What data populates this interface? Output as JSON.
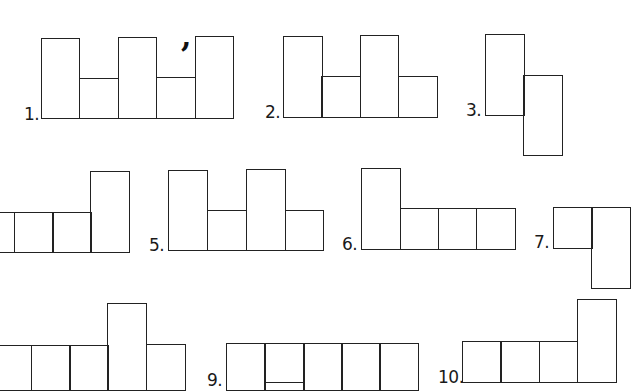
{
  "page": {
    "background": "#ffffff",
    "line_color": "#222222"
  },
  "figures": [
    {
      "label": "1.",
      "label_pos": [
        24,
        106
      ],
      "cells": [
        [
          41,
          38,
          38,
          80
        ],
        [
          79,
          78,
          39,
          40
        ],
        [
          118,
          37,
          38,
          81
        ],
        [
          156,
          77,
          39,
          41
        ],
        [
          195,
          36,
          38,
          82
        ]
      ],
      "mark": {
        "text": ",",
        "pos": [
          181,
          22
        ]
      }
    },
    {
      "label": "2.",
      "label_pos": [
        265,
        104
      ],
      "cells": [
        [
          283,
          36,
          39,
          81
        ],
        [
          321,
          76,
          39,
          41
        ],
        [
          360,
          35,
          38,
          82
        ],
        [
          398,
          76,
          39,
          41
        ]
      ]
    },
    {
      "label": "3.",
      "label_pos": [
        466,
        102
      ],
      "cells": [
        [
          485,
          34,
          39,
          81
        ],
        [
          523,
          75,
          39,
          80
        ]
      ]
    },
    {
      "label": "",
      "label_pos": [
        0,
        0
      ],
      "cells": [
        [
          -25,
          212,
          39,
          40
        ],
        [
          14,
          212,
          39,
          40
        ],
        [
          52,
          212,
          39,
          40
        ],
        [
          90,
          171,
          39,
          81
        ]
      ]
    },
    {
      "label": "5.",
      "label_pos": [
        149,
        237
      ],
      "cells": [
        [
          168,
          170,
          39,
          80
        ],
        [
          207,
          210,
          39,
          40
        ],
        [
          246,
          169,
          39,
          81
        ],
        [
          285,
          210,
          38,
          40
        ]
      ]
    },
    {
      "label": "6.",
      "label_pos": [
        342,
        236
      ],
      "cells": [
        [
          361,
          168,
          39,
          81
        ],
        [
          400,
          208,
          38,
          41
        ],
        [
          438,
          208,
          38,
          41
        ],
        [
          476,
          208,
          39,
          41
        ]
      ]
    },
    {
      "label": "7.",
      "label_pos": [
        534,
        234
      ],
      "cells": [
        [
          553,
          207,
          39,
          41
        ],
        [
          591,
          207,
          39,
          81
        ]
      ]
    },
    {
      "label": "",
      "label_pos": [
        0,
        0
      ],
      "cells": [
        [
          -8,
          345,
          39,
          45
        ],
        [
          31,
          345,
          39,
          45
        ],
        [
          69,
          345,
          39,
          45
        ],
        [
          107,
          303,
          39,
          87
        ],
        [
          146,
          344,
          39,
          46
        ]
      ]
    },
    {
      "label": "9.",
      "label_pos": [
        207,
        372
      ],
      "cells": [
        [
          226,
          343,
          39,
          47
        ],
        [
          264,
          343,
          40,
          47
        ],
        [
          303,
          343,
          39,
          47
        ],
        [
          341,
          343,
          39,
          47
        ],
        [
          379,
          343,
          39,
          47
        ]
      ],
      "inner_line": [
        264,
        382,
        40
      ]
    },
    {
      "label": "10.",
      "label_pos": [
        438,
        369
      ],
      "cells": [
        [
          462,
          341,
          39,
          41
        ],
        [
          500,
          341,
          39,
          41
        ],
        [
          539,
          341,
          38,
          41
        ],
        [
          577,
          299,
          39,
          83
        ]
      ]
    }
  ]
}
